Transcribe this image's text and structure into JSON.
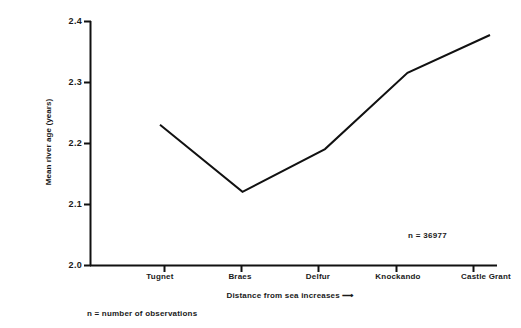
{
  "chart_data": {
    "type": "line",
    "title": "",
    "subtitle": "",
    "categories": [
      "Tugnet",
      "Braes",
      "Delfur",
      "Knockando",
      "Castle Grant"
    ],
    "values": [
      2.23,
      2.12,
      2.19,
      2.315,
      2.377
    ],
    "series": [
      {
        "name": "Mean river age",
        "values": [
          2.23,
          2.12,
          2.19,
          2.315,
          2.377
        ]
      }
    ],
    "xlabel": "Distance from sea increases ⟶",
    "ylabel": "Mean river age (years)",
    "ylim": [
      2.0,
      2.4
    ],
    "yticks": [
      2.0,
      2.1,
      2.2,
      2.3,
      2.4
    ],
    "ytick_labels": [
      "2.0",
      "2.1",
      "2.2",
      "2.3",
      "2.4"
    ],
    "grid": false,
    "legend": false,
    "legend_position": "none",
    "line_color": "#111111",
    "background_color": "#ffffff",
    "annotations": [
      {
        "name": "sample-size",
        "text": "n = 36977",
        "position": "inside-bottom-right"
      }
    ]
  },
  "footnote": {
    "text": "n = number of observations"
  }
}
